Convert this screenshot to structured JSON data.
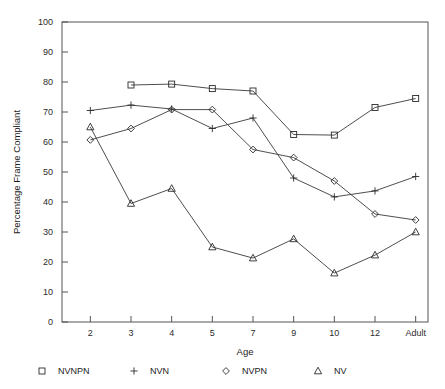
{
  "chart_data": {
    "type": "line",
    "title": "",
    "xlabel": "Age",
    "ylabel": "Percentage Frame Compliant",
    "categories": [
      "2",
      "3",
      "4",
      "5",
      "7",
      "9",
      "10",
      "12",
      "Adult"
    ],
    "ylim": [
      0,
      100
    ],
    "yticks": [
      0,
      10,
      20,
      30,
      40,
      50,
      60,
      70,
      80,
      90,
      100
    ],
    "grid": false,
    "legend_position": "bottom",
    "series": [
      {
        "name": "NVNPN",
        "marker": "square",
        "x": [
          "3",
          "4",
          "5",
          "7",
          "9",
          "10",
          "12",
          "Adult"
        ],
        "values": [
          79.0,
          79.3,
          77.8,
          77.0,
          62.5,
          62.3,
          71.5,
          74.5
        ]
      },
      {
        "name": "NVN",
        "marker": "plus",
        "x": [
          "2",
          "3",
          "4",
          "5",
          "7",
          "9",
          "10",
          "12",
          "Adult"
        ],
        "values": [
          70.5,
          72.3,
          71.0,
          64.5,
          68.0,
          48.0,
          41.7,
          43.7,
          48.5
        ]
      },
      {
        "name": "NVPN",
        "marker": "diamond",
        "x": [
          "2",
          "3",
          "4",
          "5",
          "7",
          "9",
          "10",
          "12",
          "Adult"
        ],
        "values": [
          60.7,
          64.5,
          70.8,
          70.8,
          57.5,
          54.8,
          47.0,
          36.0,
          34.0
        ]
      },
      {
        "name": "NV",
        "marker": "triangle",
        "x": [
          "2",
          "3",
          "4",
          "5",
          "7",
          "9",
          "10",
          "12",
          "Adult"
        ],
        "values": [
          65.0,
          39.5,
          44.5,
          25.0,
          21.3,
          27.7,
          16.3,
          22.3,
          30.0
        ]
      }
    ]
  },
  "legend": {
    "items": [
      {
        "symbol": "square",
        "label": "NVNPN"
      },
      {
        "symbol": "plus",
        "label": "NVN"
      },
      {
        "symbol": "diamond",
        "label": "NVPN"
      },
      {
        "symbol": "triangle",
        "label": "NV"
      }
    ]
  },
  "colors": {
    "line": "#3a3a3a",
    "frame": "#555555",
    "text": "#1a1a1a",
    "background": "#ffffff"
  },
  "page": {
    "cropped_header_text": ""
  }
}
